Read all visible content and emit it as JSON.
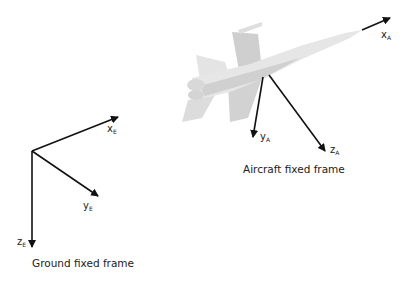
{
  "ground_frame": {
    "caption": "Ground fixed frame",
    "axes": [
      {
        "name": "x",
        "subscript": "E"
      },
      {
        "name": "y",
        "subscript": "E"
      },
      {
        "name": "z",
        "subscript": "E"
      }
    ]
  },
  "aircraft_frame": {
    "caption": "Aircraft fixed frame",
    "axes": [
      {
        "name": "x",
        "subscript": "A"
      },
      {
        "name": "y",
        "subscript": "A"
      },
      {
        "name": "z",
        "subscript": "A"
      }
    ]
  },
  "colors": {
    "axis": "#111111",
    "aircraft": "#d9d9d9"
  }
}
